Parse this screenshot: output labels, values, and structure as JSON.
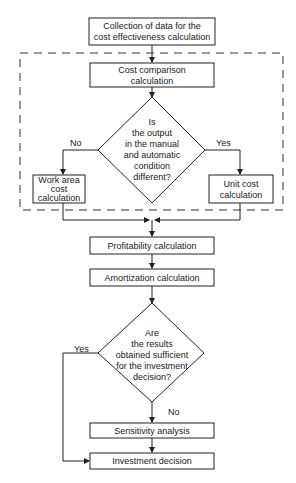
{
  "diagram": {
    "type": "flowchart",
    "nodes": {
      "collect": {
        "lines": [
          "Collection of data for the",
          "cost effectiveness calculation"
        ]
      },
      "cost_comparison": {
        "lines": [
          "Cost comparison",
          "calculation"
        ]
      },
      "decision_output": {
        "lines": [
          "Is",
          "the output",
          "in the manual",
          "and automatic",
          "condition",
          "different?"
        ]
      },
      "work_area": {
        "lines": [
          "Work area",
          "cost",
          "calculation"
        ]
      },
      "unit_cost": {
        "lines": [
          "Unit cost",
          "calculation"
        ]
      },
      "profitability": {
        "label": "Profitability calculation"
      },
      "amortization": {
        "label": "Amortization calculation"
      },
      "decision_results": {
        "lines": [
          "Are",
          "the results",
          "obtained sufficient",
          "for the investment",
          "decision?"
        ]
      },
      "sensitivity": {
        "label": "Sensitivity analysis"
      },
      "investment": {
        "label": "Investment decision"
      }
    },
    "edge_labels": {
      "output_no": "No",
      "output_yes": "Yes",
      "results_yes": "Yes",
      "results_no": "No"
    },
    "colors": {
      "line": "#222222",
      "background": "#ffffff"
    }
  }
}
